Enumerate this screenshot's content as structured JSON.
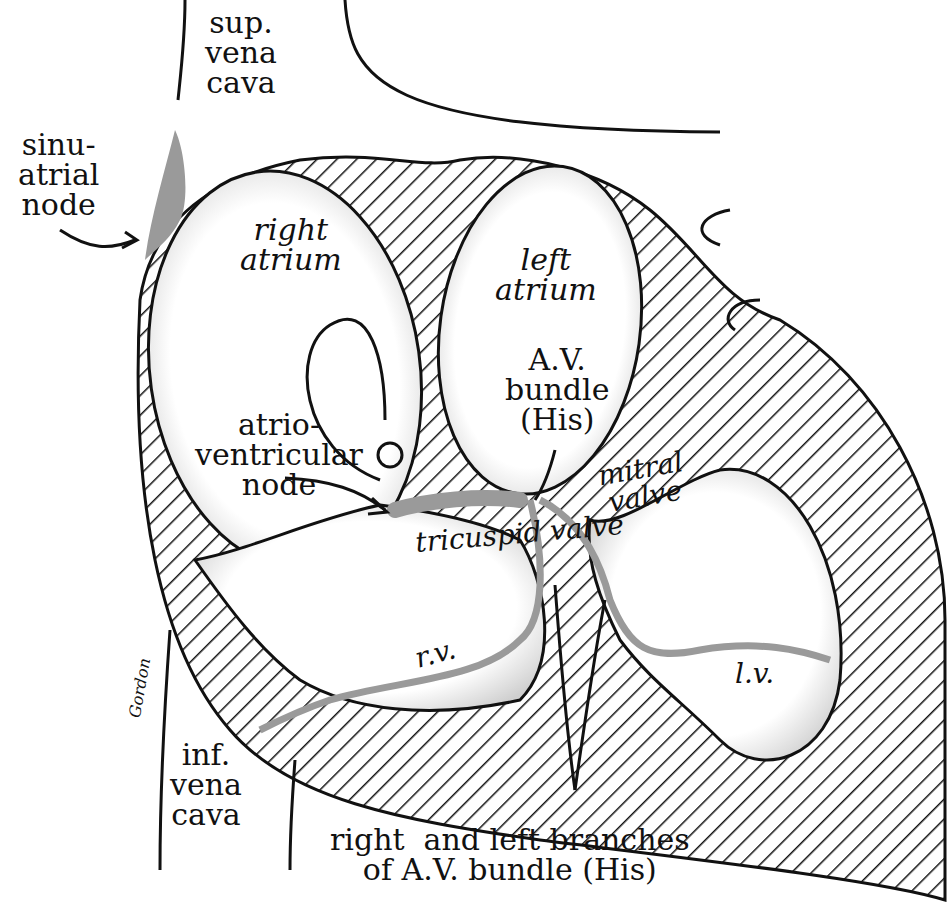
{
  "figure": {
    "top_caption_partial": "",
    "colors": {
      "ink": "#111111",
      "conduction_gray": "#9a9a9a",
      "background": "#ffffff"
    },
    "labels": {
      "sup_vena_cava": "sup.\nvena\ncava",
      "sinuatrial_node": "sinu-\natrial\nnode",
      "right_atrium": "right\natrium",
      "left_atrium": "left\natrium",
      "av_bundle": "A.V.\nbundle\n(His)",
      "atrioventricular_node": "atrio-\nventricular\nnode",
      "tricuspid_valve_1": "tricuspid",
      "tricuspid_valve_2": "tricuspid valve",
      "mitral_valve": "mitral\nvalve",
      "right_ventricle": "r.v.",
      "left_ventricle": "l.v.",
      "inf_vena_cava": "inf.\nvena\ncava",
      "branches": "right  and left branches\nof A.V. bundle (His)",
      "signature": "Gordon"
    }
  }
}
